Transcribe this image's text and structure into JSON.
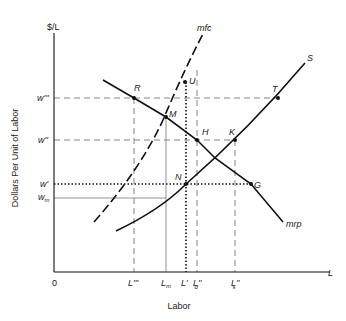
{
  "diagram": {
    "y_axis_label": "$/L",
    "y_axis_title": "Dollars Per Unit of Labor",
    "x_axis_label": "L",
    "x_axis_title": "Labor",
    "origin": "0",
    "wage_levels": {
      "w3": "w'''",
      "w2": "w''",
      "w1": "w'",
      "wm": "w",
      "wm_sub": "m"
    },
    "labor_levels": {
      "L3": "L'''",
      "Lm": "L",
      "Lm_sub": "m",
      "L1": "L'",
      "Ld": "L''",
      "Ld_sub": "d",
      "Ls": "L''",
      "Ls_sub": "s"
    },
    "curves": {
      "mfc": "mfc",
      "supply": "S",
      "mrp": "mrp"
    },
    "points": {
      "R": "R",
      "M": "M",
      "U": "U",
      "T": "T",
      "H": "H",
      "K": "K",
      "N": "N",
      "G": "G"
    }
  }
}
